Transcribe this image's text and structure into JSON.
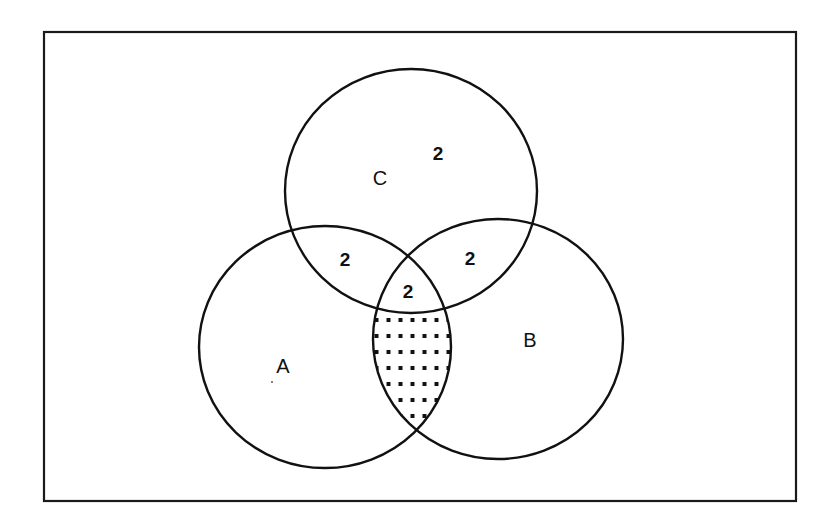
{
  "diagram": {
    "type": "venn-3-set",
    "frame": {
      "x": 44,
      "y": 32,
      "width": 752,
      "height": 469
    },
    "colors": {
      "stroke": "#111111",
      "background": "#ffffff",
      "shading": "#111111"
    },
    "sets": [
      {
        "id": "A",
        "label": "A",
        "cx": 325,
        "cy": 347,
        "rx": 126,
        "ry": 121,
        "label_x": 283,
        "label_y": 366
      },
      {
        "id": "B",
        "label": "B",
        "cx": 498,
        "cy": 339,
        "rx": 125,
        "ry": 120,
        "label_x": 530,
        "label_y": 340
      },
      {
        "id": "C",
        "label": "C",
        "cx": 411,
        "cy": 191,
        "rx": 126,
        "ry": 122,
        "label_x": 380,
        "label_y": 178
      }
    ],
    "region_counts": [
      {
        "region": "C only",
        "value": "2",
        "x": 438,
        "y": 153
      },
      {
        "region": "A∩C only",
        "value": "2",
        "x": 345,
        "y": 259
      },
      {
        "region": "B∩C only",
        "value": "2",
        "x": 470,
        "y": 258
      },
      {
        "region": "A∩B∩C",
        "value": "2",
        "x": 408,
        "y": 291
      }
    ],
    "shaded_region": {
      "region": "A∩B minus C",
      "pattern": "dots"
    }
  }
}
